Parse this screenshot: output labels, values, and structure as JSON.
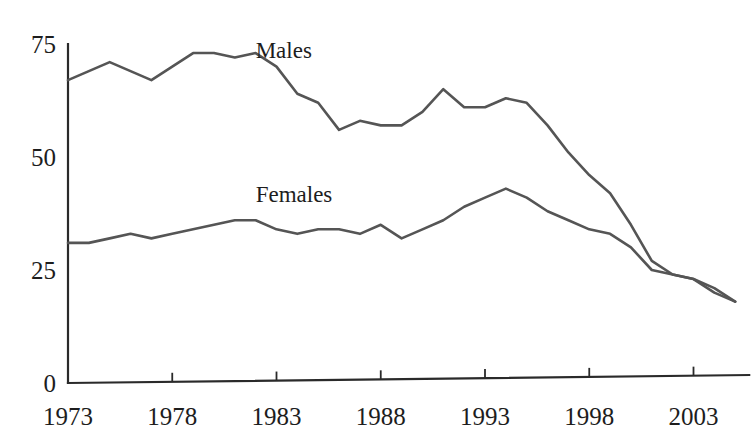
{
  "chart_data": {
    "type": "line",
    "title": "",
    "subtitle": "",
    "xlabel": "",
    "ylabel": "",
    "xlim": [
      1973,
      2005
    ],
    "ylim": [
      0,
      75
    ],
    "grid": false,
    "legend_position": "inline-annotation",
    "x_ticks": [
      1973,
      1978,
      1983,
      1988,
      1993,
      1998,
      2003
    ],
    "x_tick_labels": [
      "1973",
      "1978",
      "1983",
      "1988",
      "1993",
      "1998",
      "2003"
    ],
    "y_ticks": [
      0,
      25,
      50,
      75
    ],
    "y_tick_labels": [
      "0",
      "25",
      "50",
      "75"
    ],
    "x": [
      1973,
      1974,
      1975,
      1976,
      1977,
      1978,
      1979,
      1980,
      1981,
      1982,
      1983,
      1984,
      1985,
      1986,
      1987,
      1988,
      1989,
      1990,
      1991,
      1992,
      1993,
      1994,
      1995,
      1996,
      1997,
      1998,
      1999,
      2000,
      2001,
      2002,
      2003,
      2004,
      2005
    ],
    "series": [
      {
        "name": "Males",
        "color": "#555555",
        "label_x": 1982,
        "label_y": 72,
        "values": [
          67,
          69,
          71,
          69,
          67,
          70,
          73,
          73,
          72,
          73,
          70,
          64,
          62,
          56,
          58,
          57,
          57,
          60,
          65,
          61,
          61,
          63,
          62,
          57,
          51,
          46,
          42,
          35,
          27,
          24,
          23,
          21,
          18
        ]
      },
      {
        "name": "Females",
        "color": "#555555",
        "label_x": 1982,
        "label_y": 40,
        "values": [
          31,
          31,
          32,
          33,
          32,
          33,
          34,
          35,
          36,
          36,
          34,
          33,
          34,
          34,
          33,
          35,
          32,
          34,
          36,
          39,
          41,
          43,
          41,
          38,
          36,
          34,
          33,
          30,
          25,
          24,
          23,
          20,
          18
        ]
      }
    ]
  },
  "annotations": {
    "males_label": "Males",
    "females_label": "Females"
  }
}
